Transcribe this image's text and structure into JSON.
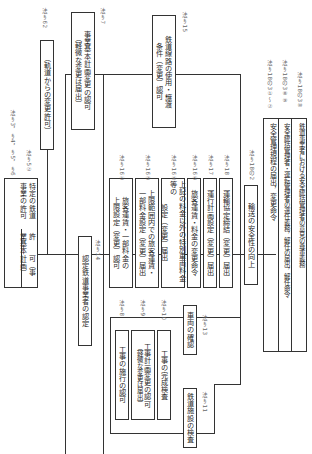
{
  "diagram": {
    "root": {
      "title": "許　　可（事業基本計画）",
      "subtitle": "特定の鉄道事業の許可",
      "ref_title": "法§3，§4，§5，§6",
      "ref_subtitle": "法§5②"
    },
    "track_change": {
      "label": "（軌道からの変更許可）",
      "ref": "法§62"
    },
    "plan_change": {
      "label_line1": "事業基本計画変更の認可",
      "label_line2": "（軽微な変更は届出）",
      "ref": "法§7"
    },
    "facility_use": {
      "label_line1": "鉄道線路の使用・譲渡",
      "label_line2": "条件（変更）認可",
      "ref": "法§15"
    },
    "fares": [
      {
        "label_line1": "旅客運賃・一部料金の",
        "label_line2": "上限設定（変更）認可",
        "ref": "法§16①"
      },
      {
        "label_line1": "上限範囲内での旅客運賃・",
        "label_line2": "一部料金設定（変更）届出",
        "ref": "法§16③"
      },
      {
        "label_line1": "上記の料金以外の特別車両料金等の",
        "label_line2": "設定（変更）届出",
        "ref": "法§16④"
      },
      {
        "label_line1": "旅客運賃・料金の変更命令",
        "label_line2": "",
        "ref": "法§16⑤"
      },
      {
        "label_line1": "運行計画設定（変更）届出",
        "label_line2": "",
        "ref": "法§17"
      },
      {
        "label_line1": "運輸協定締結（変更）届出",
        "label_line2": "",
        "ref": "法§18"
      }
    ],
    "safety": {
      "label": "輸送の安全性の向上",
      "ref": "法§18の2"
    },
    "safety_items": [
      {
        "label": "安全管理規程の届出，変更命令",
        "ref": ""
      },
      {
        "label": "安全統括管理者・運転管理者の選任義務，解任の届出，解任命令",
        "ref": "法§18の3①〜⑦"
      },
      {
        "label": "鉄道事業者における安全統括管理者の意見の尊重義務",
        "ref": "法§18の3⑧"
      }
    ],
    "safety_refs": [
      "法§18の3①〜⑦",
      "法§18の3⑧⑨",
      "法§18の3⑩"
    ],
    "certification": {
      "label": "認定鉄道事業者の認定",
      "ref": "法§14"
    },
    "construction": [
      {
        "label_line1": "工事の施行の認可",
        "label_line2": "",
        "ref": "法§8"
      },
      {
        "label_line1": "工事計画変更の認可",
        "label_line2": "（軽微な変更は届出）",
        "ref": "法§9"
      },
      {
        "label_line1": "工事の完成検査",
        "label_line2": "",
        "ref": "法§10"
      }
    ],
    "vehicle_check": {
      "label": "車両の確認",
      "ref": "法§13"
    },
    "facility_inspection": {
      "label": "鉄道施設の検査",
      "ref": "法§11"
    }
  }
}
